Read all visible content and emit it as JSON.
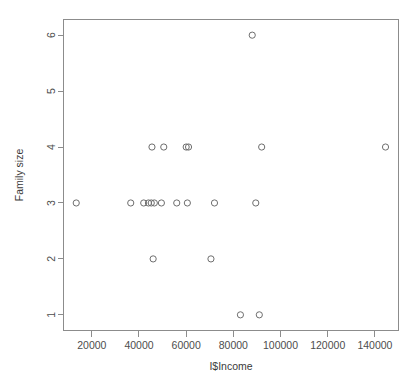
{
  "chart_data": {
    "type": "scatter",
    "title": "",
    "xlabel": "I$Income",
    "ylabel": "Family size",
    "xlim": [
      8000,
      150000
    ],
    "ylim": [
      0.72,
      6.28
    ],
    "grid": false,
    "legend": null,
    "xticks": [
      20000,
      40000,
      60000,
      80000,
      100000,
      120000,
      140000
    ],
    "xtick_labels": [
      "20000",
      "40000",
      "60000",
      "80000",
      "100000",
      "120000",
      "140000"
    ],
    "yticks": [
      1,
      2,
      3,
      4,
      5,
      6
    ],
    "ytick_labels": [
      "1",
      "2",
      "3",
      "4",
      "5",
      "6"
    ],
    "marker": "open-circle",
    "marker_color": "#6e6e6e",
    "points": [
      {
        "x": 13400,
        "y": 3
      },
      {
        "x": 36500,
        "y": 3
      },
      {
        "x": 42000,
        "y": 3
      },
      {
        "x": 44000,
        "y": 3
      },
      {
        "x": 45200,
        "y": 3
      },
      {
        "x": 46500,
        "y": 3
      },
      {
        "x": 49500,
        "y": 3
      },
      {
        "x": 56000,
        "y": 3
      },
      {
        "x": 60500,
        "y": 3
      },
      {
        "x": 72000,
        "y": 3
      },
      {
        "x": 89500,
        "y": 3
      },
      {
        "x": 45500,
        "y": 4
      },
      {
        "x": 50500,
        "y": 4
      },
      {
        "x": 60000,
        "y": 4
      },
      {
        "x": 61000,
        "y": 4
      },
      {
        "x": 92000,
        "y": 4
      },
      {
        "x": 144500,
        "y": 4
      },
      {
        "x": 46000,
        "y": 2
      },
      {
        "x": 70500,
        "y": 2
      },
      {
        "x": 83000,
        "y": 1
      },
      {
        "x": 91000,
        "y": 1
      },
      {
        "x": 88000,
        "y": 6
      }
    ]
  },
  "axes": {
    "x_label": "I$Income",
    "y_label": "Family size"
  }
}
